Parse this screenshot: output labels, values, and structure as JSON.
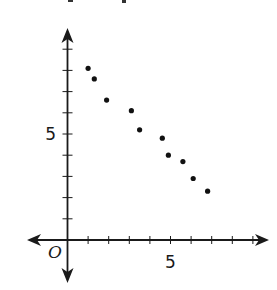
{
  "chart_data": {
    "type": "scatter",
    "title": "",
    "xlabel": "",
    "ylabel": "",
    "origin_label": "O",
    "x_tick_labels": [
      {
        "value": 5,
        "label": "5"
      }
    ],
    "y_tick_labels": [
      {
        "value": 5,
        "label": "5"
      }
    ],
    "xlim": [
      -1.9,
      9.7
    ],
    "ylim": [
      -2.0,
      10.0
    ],
    "x_ticks": [
      1,
      2,
      3,
      4,
      5,
      6,
      7,
      8,
      9
    ],
    "y_ticks": [
      1,
      2,
      3,
      4,
      5,
      6,
      7,
      8,
      9
    ],
    "grid": false,
    "legend": null,
    "axes_arrows": true,
    "series": [
      {
        "name": "points",
        "color": "#111111",
        "points": [
          {
            "x": 1.0,
            "y": 8.1
          },
          {
            "x": 1.3,
            "y": 7.6
          },
          {
            "x": 1.9,
            "y": 6.6
          },
          {
            "x": 3.1,
            "y": 6.1
          },
          {
            "x": 3.5,
            "y": 5.2
          },
          {
            "x": 4.6,
            "y": 4.8
          },
          {
            "x": 4.9,
            "y": 4.0
          },
          {
            "x": 5.6,
            "y": 3.7
          },
          {
            "x": 6.1,
            "y": 2.9
          },
          {
            "x": 6.8,
            "y": 2.3
          }
        ]
      }
    ]
  },
  "colors": {
    "axis": "#1a1a1a",
    "point": "#111111",
    "background": "#ffffff"
  }
}
